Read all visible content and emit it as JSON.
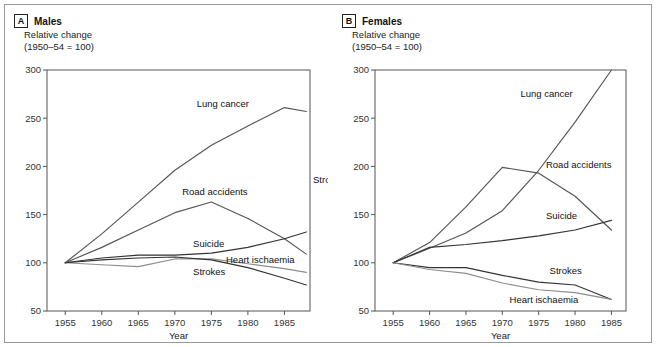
{
  "figure": {
    "width": 656,
    "height": 347,
    "background": "#ffffff",
    "border_color": "#9a9a9a"
  },
  "panels": [
    {
      "letter": "A",
      "title": "Males",
      "caption_line1": "Relative change",
      "caption_line2": "(1950–54 = 100)"
    },
    {
      "letter": "B",
      "title": "Females",
      "caption_line1": "Relative change",
      "caption_line2": "(1950–54 = 100)"
    }
  ],
  "chart_data": [
    {
      "type": "line",
      "panel": "A",
      "title": "Males",
      "subtitle": "Relative change (1950–54 = 100)",
      "xlabel": "Year",
      "ylabel": "Relative change (1950–54 = 100)",
      "xlim": [
        1952.5,
        1988.5
      ],
      "ylim": [
        50,
        300
      ],
      "xticks": [
        1955,
        1960,
        1965,
        1970,
        1975,
        1980,
        1985
      ],
      "yticks": [
        50,
        100,
        150,
        200,
        250,
        300
      ],
      "grid": false,
      "legend_position": "inline-labels",
      "series": [
        {
          "name": "Lung cancer",
          "color": "#555555",
          "x": [
            1955,
            1960,
            1965,
            1970,
            1975,
            1980,
            1985,
            1988
          ],
          "values": [
            100,
            130,
            163,
            196,
            222,
            242,
            261,
            257
          ]
        },
        {
          "name": "Road accidents",
          "color": "#555555",
          "x": [
            1955,
            1960,
            1965,
            1970,
            1975,
            1980,
            1985,
            1988
          ],
          "values": [
            100,
            116,
            134,
            152,
            163,
            146,
            125,
            109
          ]
        },
        {
          "name": "Suicide",
          "color": "#333333",
          "x": [
            1955,
            1960,
            1965,
            1970,
            1975,
            1980,
            1985,
            1988
          ],
          "values": [
            100,
            105,
            108,
            108,
            110,
            116,
            125,
            132
          ]
        },
        {
          "name": "Heart ischaemia",
          "color": "#8d8d8d",
          "x": [
            1955,
            1960,
            1965,
            1970,
            1975,
            1980,
            1985,
            1988
          ],
          "values": [
            100,
            98,
            96,
            104,
            104,
            99,
            94,
            90
          ]
        },
        {
          "name": "Strokes",
          "color": "#333333",
          "x": [
            1955,
            1960,
            1965,
            1970,
            1975,
            1980,
            1985,
            1988
          ],
          "values": [
            100,
            103,
            105,
            106,
            103,
            95,
            84,
            77
          ]
        }
      ],
      "annotations": [
        {
          "text": "Lung cancer",
          "x": 1973.0,
          "y": 262
        },
        {
          "text": "Road accidents",
          "x": 1971.0,
          "y": 170
        },
        {
          "text": "Suicide",
          "x": 1972.5,
          "y": 116
        },
        {
          "text": "Heart ischaemia",
          "x": 1977.0,
          "y": 100
        },
        {
          "text": "Strokes",
          "x": 1972.5,
          "y": 87
        }
      ],
      "edge_annotation": {
        "text": "Strokes",
        "note": "label at right margin of panel A"
      }
    },
    {
      "type": "line",
      "panel": "B",
      "title": "Females",
      "subtitle": "Relative change (1950–54 = 100)",
      "xlabel": "Year",
      "ylabel": "Relative change (1950–54 = 100)",
      "xlim": [
        1952.5,
        1987.0
      ],
      "ylim": [
        50,
        300
      ],
      "xticks": [
        1955,
        1960,
        1965,
        1970,
        1975,
        1980,
        1985
      ],
      "yticks": [
        50,
        100,
        150,
        200,
        250,
        300
      ],
      "grid": false,
      "legend_position": "inline-labels",
      "series": [
        {
          "name": "Lung cancer",
          "color": "#555555",
          "x": [
            1955,
            1960,
            1965,
            1970,
            1975,
            1980,
            1985
          ],
          "values": [
            100,
            115,
            131,
            154,
            196,
            246,
            300
          ]
        },
        {
          "name": "Road accidents",
          "color": "#555555",
          "x": [
            1955,
            1960,
            1965,
            1970,
            1975,
            1980,
            1985
          ],
          "values": [
            100,
            121,
            158,
            199,
            193,
            169,
            134
          ]
        },
        {
          "name": "Suicide",
          "color": "#333333",
          "x": [
            1955,
            1960,
            1965,
            1970,
            1975,
            1980,
            1985
          ],
          "values": [
            100,
            116,
            119,
            123,
            128,
            134,
            144
          ]
        },
        {
          "name": "Strokes",
          "color": "#333333",
          "x": [
            1955,
            1960,
            1965,
            1970,
            1975,
            1980,
            1985
          ],
          "values": [
            100,
            95,
            95,
            87,
            80,
            77,
            62
          ]
        },
        {
          "name": "Heart ischaemia",
          "color": "#8d8d8d",
          "x": [
            1955,
            1960,
            1965,
            1970,
            1975,
            1980,
            1985
          ],
          "values": [
            100,
            93,
            89,
            79,
            72,
            69,
            62
          ]
        }
      ],
      "annotations": [
        {
          "text": "Lung cancer",
          "x": 1972.5,
          "y": 272
        },
        {
          "text": "Road accidents",
          "x": 1976.0,
          "y": 198
        },
        {
          "text": "Suicide",
          "x": 1976.0,
          "y": 145
        },
        {
          "text": "Strokes",
          "x": 1976.5,
          "y": 88
        },
        {
          "text": "Heart ischaemia",
          "x": 1971.0,
          "y": 58
        }
      ]
    }
  ]
}
